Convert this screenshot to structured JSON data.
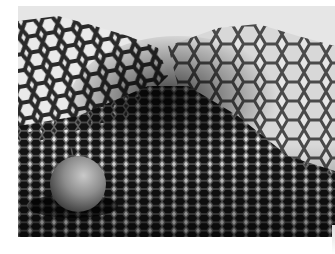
{
  "image": {
    "subject": "honeycomb-structure-with-fruit",
    "colors": {
      "sky": "#e8e8e8",
      "honeycomb_dark": "#1a1a1a",
      "honeycomb_wall": "#5a5a5a",
      "highlight": "#cfcfcf",
      "fruit": "#8a8a8a"
    }
  }
}
